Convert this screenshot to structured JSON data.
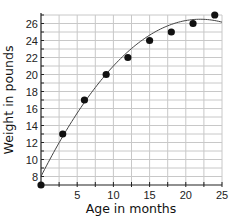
{
  "chart_data": {
    "type": "scatter",
    "title": "",
    "xlabel": "Age in months",
    "ylabel": "Weight in pounds",
    "xlim": [
      0,
      25
    ],
    "ylim": [
      7,
      27
    ],
    "x_ticks": [
      5,
      10,
      15,
      20,
      25
    ],
    "x_minor_step": 2.5,
    "y_ticks": [
      8,
      10,
      12,
      14,
      16,
      18,
      20,
      22,
      24,
      26
    ],
    "y_minor_step": 1,
    "grid": true,
    "series": [
      {
        "name": "Weight",
        "type": "scatter",
        "x": [
          0,
          3,
          6,
          9,
          12,
          15,
          18,
          21,
          24
        ],
        "y": [
          7,
          13,
          17,
          20,
          22,
          24,
          25,
          26,
          27
        ]
      },
      {
        "name": "Trend curve",
        "type": "line",
        "model": "quadratic",
        "vertex_x": 22,
        "vertex_y": 26.5,
        "a": -0.0382,
        "x_range": [
          0,
          25
        ]
      }
    ]
  }
}
